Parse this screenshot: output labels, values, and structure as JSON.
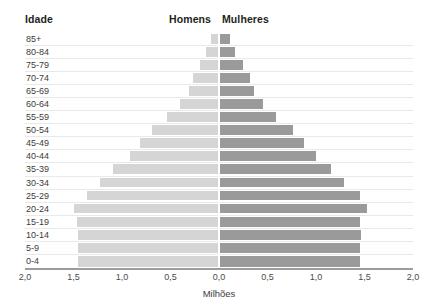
{
  "header": {
    "age_label": "Idade",
    "male_label": "Homens",
    "female_label": "Mulheres"
  },
  "axis": {
    "title": "Milhões",
    "ticks": [
      "2,0",
      "1,5",
      "1,0",
      "0,5",
      "0,0",
      "0,5",
      "1,0",
      "1,5",
      "2,0"
    ]
  },
  "colors": {
    "male_bar": "#d5d5d5",
    "female_bar": "#9a9a9a",
    "gridline": "#e9e9e9",
    "axis_line": "#9c9c9c",
    "text": "#231f20"
  },
  "chart_data": {
    "type": "bar",
    "subtype": "population-pyramid",
    "title": "",
    "xlabel": "Milhões",
    "ylabel": "Idade",
    "xlim": [
      -2.0,
      2.0
    ],
    "xticks": [
      -2.0,
      -1.5,
      -1.0,
      -0.5,
      0.0,
      0.5,
      1.0,
      1.5,
      2.0
    ],
    "xticklabels": [
      "2,0",
      "1,5",
      "1,0",
      "0,5",
      "0,0",
      "0,5",
      "1,0",
      "1,5",
      "2,0"
    ],
    "grid": true,
    "legend": [
      "Homens",
      "Mulheres"
    ],
    "legend_position": "top-center",
    "categories": [
      "85+",
      "80-84",
      "75-79",
      "70-74",
      "65-69",
      "60-64",
      "55-59",
      "50-54",
      "45-49",
      "40-44",
      "35-39",
      "30-34",
      "25-29",
      "20-24",
      "15-19",
      "10-14",
      "5-9",
      "0-4"
    ],
    "series": [
      {
        "name": "Homens",
        "values": [
          0.08,
          0.13,
          0.2,
          0.27,
          0.31,
          0.4,
          0.54,
          0.69,
          0.81,
          0.92,
          1.09,
          1.23,
          1.36,
          1.5,
          1.46,
          1.45,
          1.45,
          1.45
        ]
      },
      {
        "name": "Mulheres",
        "values": [
          0.11,
          0.17,
          0.25,
          0.32,
          0.36,
          0.45,
          0.59,
          0.76,
          0.88,
          1.0,
          1.15,
          1.29,
          1.45,
          1.53,
          1.45,
          1.46,
          1.45,
          1.45
        ]
      }
    ]
  }
}
